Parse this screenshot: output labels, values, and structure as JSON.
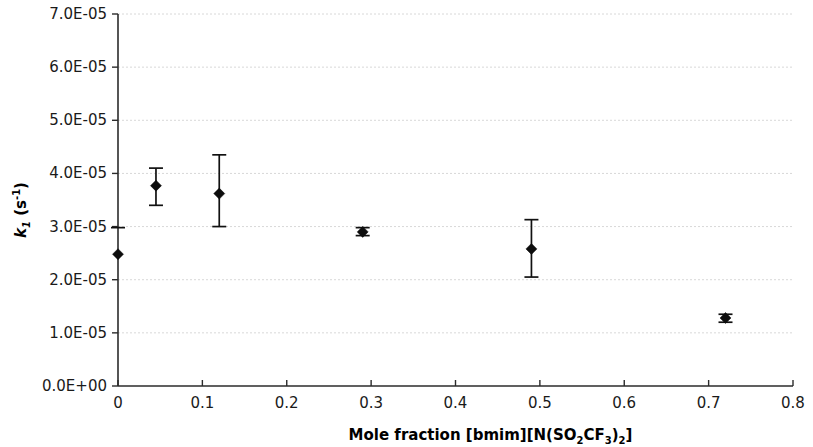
{
  "chart_data": {
    "type": "scatter",
    "title": "",
    "xlabel": "Mole fraction [bmim][N(SO2CF3)2]",
    "xlabel_parts": [
      {
        "t": "Mole fraction [bmim][N(SO",
        "s": "normal"
      },
      {
        "t": "2",
        "s": "sub"
      },
      {
        "t": "CF",
        "s": "normal"
      },
      {
        "t": "3",
        "s": "sub"
      },
      {
        "t": ")",
        "s": "normal"
      },
      {
        "t": "2",
        "s": "sub"
      },
      {
        "t": "]",
        "s": "normal"
      }
    ],
    "ylabel": "k1 (s-1)",
    "ylabel_parts": [
      {
        "t": "k",
        "s": "italic"
      },
      {
        "t": "1",
        "s": "sub-italic"
      },
      {
        "t": " (s",
        "s": "normal"
      },
      {
        "t": "-1",
        "s": "sup"
      },
      {
        "t": ")",
        "s": "normal"
      }
    ],
    "xlim": [
      0,
      0.8
    ],
    "ylim": [
      0,
      7e-05
    ],
    "grid": true,
    "grid_axis": "y",
    "legend": false,
    "error_bars": "y",
    "x_ticks": [
      0,
      0.1,
      0.2,
      0.3,
      0.4,
      0.5,
      0.6,
      0.7,
      0.8
    ],
    "x_tick_labels": [
      "0",
      "0.1",
      "0.2",
      "0.3",
      "0.4",
      "0.5",
      "0.6",
      "0.7",
      "0.8"
    ],
    "y_ticks": [
      0,
      1e-05,
      2e-05,
      3e-05,
      4e-05,
      5e-05,
      6e-05,
      7e-05
    ],
    "y_tick_labels": [
      "0.0E+00",
      "1.0E-05",
      "2.0E-05",
      "3.0E-05",
      "4.0E-05",
      "5.0E-05",
      "6.0E-05",
      "7.0E-05"
    ],
    "marker_style": "filled-diamond",
    "marker_color": "#0d0d0d",
    "series": [
      {
        "name": "k1 vs mole fraction",
        "points": [
          {
            "x": 0.0,
            "y": 2.48e-05,
            "yerr_low": 2.48e-05,
            "yerr_high": 2.48e-05
          },
          {
            "x": 0.045,
            "y": 3.77e-05,
            "yerr_low": 3.4e-05,
            "yerr_high": 4.1e-05
          },
          {
            "x": 0.12,
            "y": 3.62e-05,
            "yerr_low": 3e-05,
            "yerr_high": 4.35e-05
          },
          {
            "x": 0.29,
            "y": 2.9e-05,
            "yerr_low": 2.83e-05,
            "yerr_high": 2.98e-05
          },
          {
            "x": 0.49,
            "y": 2.58e-05,
            "yerr_low": 2.05e-05,
            "yerr_high": 3.13e-05
          },
          {
            "x": 0.72,
            "y": 1.28e-05,
            "yerr_low": 1.2e-05,
            "yerr_high": 1.35e-05
          }
        ]
      }
    ],
    "first_point_error": {
      "x": 0.0,
      "y": 2.48e-05,
      "yerr_low": 2.48e-05,
      "yerr_high": 2.98e-05
    }
  },
  "colors": {
    "axis": "#2b2b2b",
    "grid": "#d8d8d8",
    "marker": "#0d0d0d",
    "background": "#ffffff",
    "text": "#1a1a1a"
  }
}
